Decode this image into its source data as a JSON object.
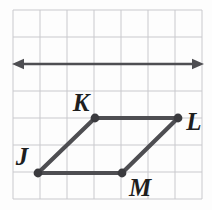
{
  "figure": {
    "background_color": "#fdfdfd",
    "grid": {
      "color": "#c9c9cd",
      "line_width": 1,
      "spacing": 27,
      "x_start": 13,
      "y_start": 10,
      "x_end": 202,
      "y_end": 199,
      "columns": 7,
      "rows": 7
    },
    "line": {
      "name": "horizontal-double-arrow",
      "color": "#4e4e52",
      "stroke_width": 2.6,
      "y": 64,
      "x_start": 12,
      "x_end": 204,
      "arrow_left": true,
      "arrow_right": true
    },
    "shape": {
      "name": "parallelogram-jklm",
      "stroke_color": "#4e4e52",
      "stroke_width": 4.2,
      "vertex_color": "#3a3a3e",
      "vertex_radius": 4.4,
      "vertices": [
        {
          "label": "J",
          "x": 38,
          "y": 173,
          "label_x": 22,
          "label_y": 165,
          "label_anchor": "middle"
        },
        {
          "label": "K",
          "x": 95,
          "y": 118,
          "label_x": 81,
          "label_y": 111,
          "label_anchor": "middle"
        },
        {
          "label": "L",
          "x": 178,
          "y": 118,
          "label_x": 194,
          "label_y": 130,
          "label_anchor": "middle"
        },
        {
          "label": "M",
          "x": 122,
          "y": 173,
          "label_x": 140,
          "label_y": 196,
          "label_anchor": "middle"
        }
      ],
      "label_font_size": 25
    }
  }
}
